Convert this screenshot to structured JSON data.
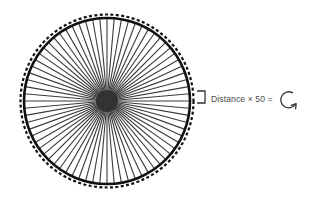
{
  "diagram": {
    "wheel": {
      "center": [
        107,
        101
      ],
      "rim_radius": 83,
      "tire_radius": 86.5,
      "spoke_count": 72,
      "hub_radius": 11,
      "rim_color": "#111111",
      "spoke_color": "#3a3a3a",
      "hub_color": "#333333"
    },
    "bracket": {
      "color": "#333333"
    },
    "equation_label": "Distance × 50 =",
    "result_icon": "rotate-clockwise-icon"
  }
}
